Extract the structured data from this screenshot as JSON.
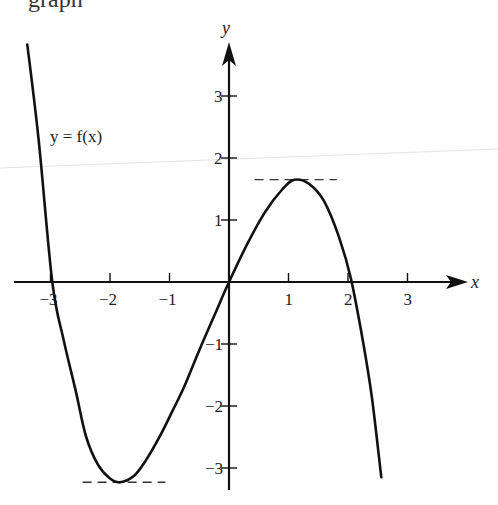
{
  "header_fragment": "graph",
  "chart_data": {
    "type": "line",
    "title": "",
    "function_label": "y = f(x)",
    "xlabel": "x",
    "ylabel": "y",
    "xlim": [
      -3.6,
      4.2
    ],
    "ylim": [
      -3.5,
      3.9
    ],
    "grid": false,
    "legend": "none",
    "x_ticks": [
      -3,
      -2,
      -1,
      1,
      2,
      3
    ],
    "x_tick_labels": [
      "−3",
      "−2",
      "−1",
      "1",
      "2",
      "3"
    ],
    "y_ticks": [
      -3,
      -2,
      -1,
      1,
      2,
      3
    ],
    "y_tick_labels": [
      "−3",
      "−2",
      "−1",
      "1",
      "2",
      "3"
    ],
    "series": [
      {
        "name": "f(x)",
        "x": [
          -3.39,
          -3.2,
          -2.97,
          -2.78,
          -2.58,
          -2.4,
          -2.2,
          -2.0,
          -1.83,
          -1.6,
          -1.4,
          -1.18,
          -0.96,
          -0.75,
          -0.5,
          -0.25,
          0.0,
          0.3,
          0.6,
          0.9,
          1.1,
          1.35,
          1.6,
          1.85,
          2.05,
          2.25,
          2.4,
          2.56
        ],
        "y": [
          3.83,
          2.3,
          0.0,
          -0.93,
          -1.74,
          -2.5,
          -2.95,
          -3.17,
          -3.23,
          -3.13,
          -2.88,
          -2.52,
          -2.1,
          -1.68,
          -1.1,
          -0.55,
          0.0,
          0.6,
          1.12,
          1.5,
          1.65,
          1.58,
          1.3,
          0.72,
          0.05,
          -0.95,
          -1.85,
          -3.15
        ]
      }
    ],
    "annotations": [
      {
        "type": "dashed_hline",
        "y": 1.65,
        "x_from": 0.43,
        "x_to": 1.81,
        "label": "local maximum"
      },
      {
        "type": "dashed_hline",
        "y": -3.23,
        "x_from": -2.46,
        "x_to": -1.07,
        "label": "local minimum"
      }
    ],
    "roots": [
      -2.97,
      0,
      2.1
    ],
    "local_max": {
      "x": 1.1,
      "y": 1.65
    },
    "local_min": {
      "x": -1.83,
      "y": -3.23
    }
  }
}
